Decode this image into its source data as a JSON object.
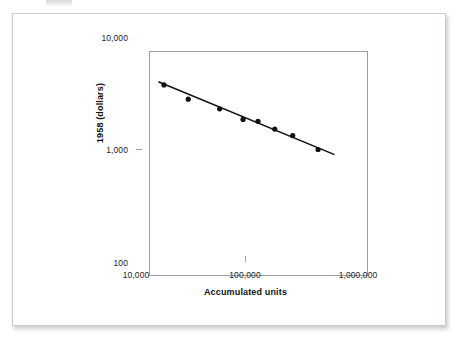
{
  "figure": {
    "background_color": "#ffffff",
    "page_border_color": "#c9cacd",
    "axis_color": "#9a9da2",
    "data_color": "#111111"
  },
  "chart_data": {
    "type": "scatter",
    "title": "",
    "subtitle": "",
    "xlabel": "Accumulated units",
    "ylabel": "1958 (dollars)",
    "xscale": "log",
    "yscale": "log",
    "xlim": [
      10000,
      1000000
    ],
    "ylim": [
      100,
      10000
    ],
    "grid": false,
    "legend": null,
    "x_tick_labels": [
      "10,000",
      "100,000",
      "1,000,000"
    ],
    "x_ticks": [
      10000,
      100000,
      1000000
    ],
    "y_tick_labels": [
      "10,000",
      "1,000",
      "100"
    ],
    "y_ticks": [
      10000,
      1000,
      100
    ],
    "series": [
      {
        "name": "Unit cost observations",
        "marker": "filled-circle",
        "x": [
          18000,
          30000,
          58000,
          95000,
          130000,
          185000,
          270000,
          460000
        ],
        "y": [
          3750,
          2800,
          2300,
          1850,
          1780,
          1520,
          1330,
          1000
        ]
      },
      {
        "name": "Fitted learning curve",
        "type": "line",
        "x": [
          16000,
          650000
        ],
        "y": [
          4000,
          900
        ]
      }
    ],
    "annotations": []
  }
}
